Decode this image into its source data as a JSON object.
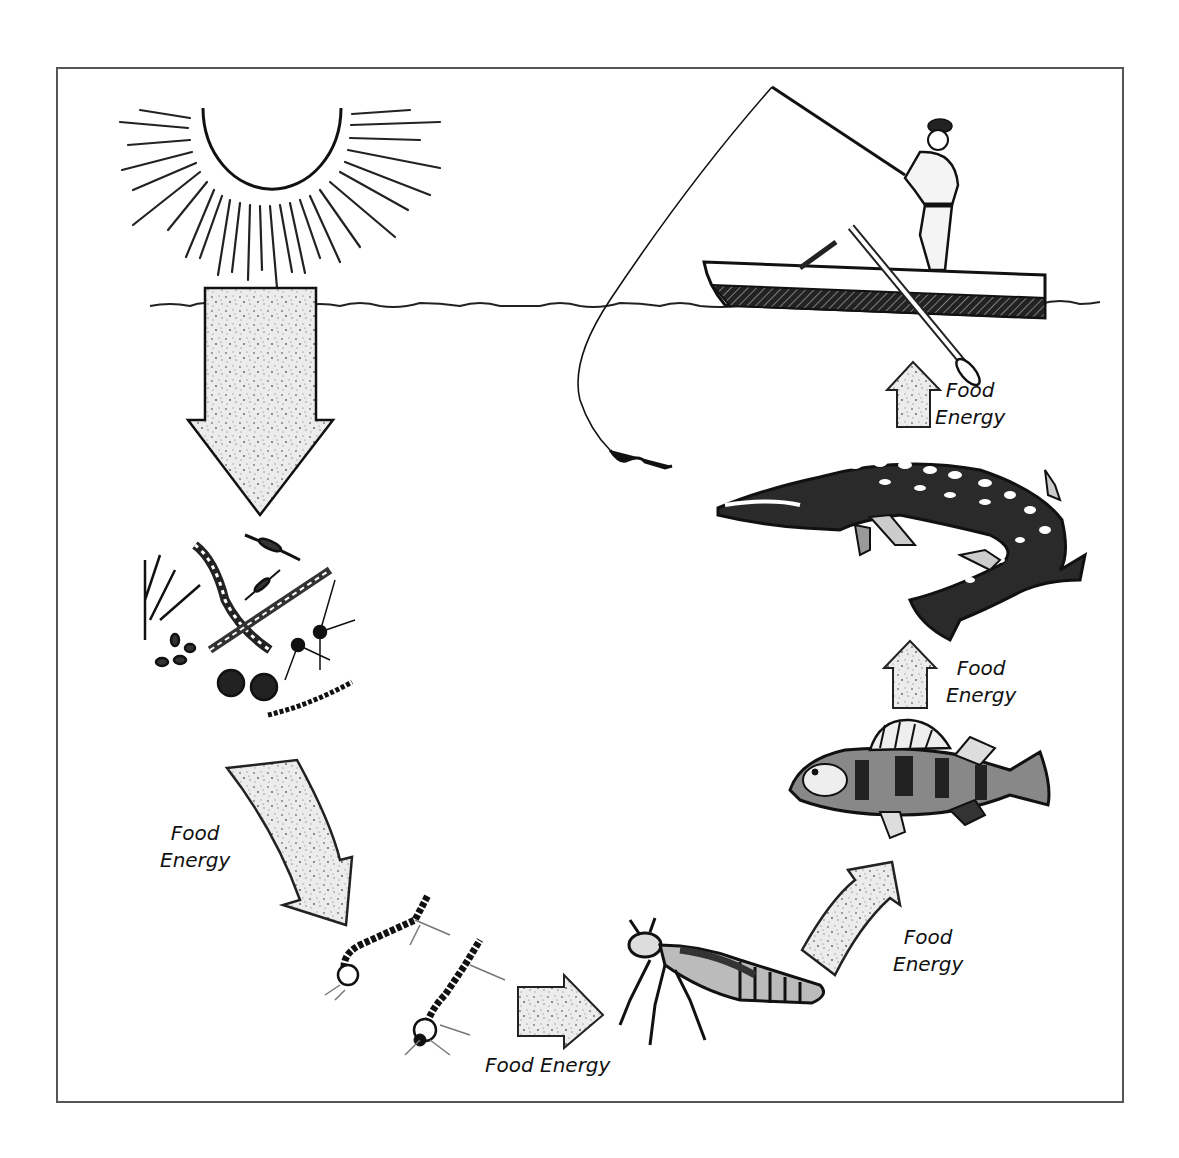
{
  "diagram": {
    "type": "aquatic food chain",
    "elements": [
      {
        "id": "sun",
        "label": "Sun"
      },
      {
        "id": "water-surface",
        "label": "Water surface"
      },
      {
        "id": "phytoplankton",
        "label": "Algae / plankton"
      },
      {
        "id": "midge-larvae",
        "label": "Insect larvae"
      },
      {
        "id": "dragonfly-nymph",
        "label": "Dragonfly nymph"
      },
      {
        "id": "perch",
        "label": "Perch"
      },
      {
        "id": "pike",
        "label": "Pike"
      },
      {
        "id": "fisherman",
        "label": "Fisherman in boat"
      }
    ],
    "flow": [
      {
        "from": "sun",
        "to": "phytoplankton",
        "label": ""
      },
      {
        "from": "phytoplankton",
        "to": "midge-larvae",
        "label": "Food Energy"
      },
      {
        "from": "midge-larvae",
        "to": "dragonfly-nymph",
        "label": "Food Energy"
      },
      {
        "from": "dragonfly-nymph",
        "to": "perch",
        "label": "Food Energy"
      },
      {
        "from": "perch",
        "to": "pike",
        "label": "Food Energy"
      },
      {
        "from": "pike",
        "to": "fisherman",
        "label": "Food Energy"
      }
    ]
  },
  "labels": {
    "plankton_to_larvae": {
      "line1": "Food",
      "line2": "Energy"
    },
    "larvae_to_nymph": {
      "line1": "Food Energy"
    },
    "nymph_to_perch": {
      "line1": "Food",
      "line2": "Energy"
    },
    "perch_to_pike": {
      "line1": "Food",
      "line2": "Energy"
    },
    "pike_to_fisherman": {
      "line1": "Food",
      "line2": "Energy"
    }
  },
  "colors": {
    "line": "#111111",
    "arrow_fill": "#e6e6e6",
    "frame": "#555555",
    "background": "#ffffff"
  }
}
